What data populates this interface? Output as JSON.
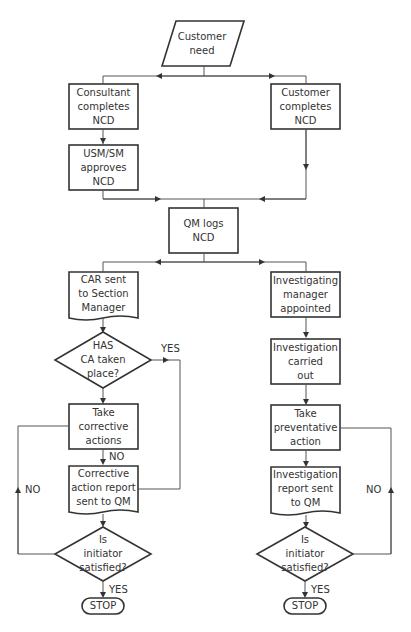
{
  "diagram": {
    "nodes": {
      "customer_need": {
        "lines": [
          "Customer",
          "need"
        ],
        "shape": "parallelogram"
      },
      "consultant_completes": {
        "lines": [
          "Consultant",
          "completes",
          "NCD"
        ],
        "shape": "process"
      },
      "usm_approves": {
        "lines": [
          "USM/SM",
          "approves",
          "NCD"
        ],
        "shape": "process"
      },
      "customer_completes": {
        "lines": [
          "Customer",
          "completes",
          "NCD"
        ],
        "shape": "process"
      },
      "qm_logs": {
        "lines": [
          "QM logs",
          "NCD"
        ],
        "shape": "process"
      },
      "car_sent": {
        "lines": [
          "CAR sent",
          "to Section",
          "Manager"
        ],
        "shape": "document"
      },
      "has_ca": {
        "lines": [
          "HAS",
          "CA taken",
          "place?"
        ],
        "shape": "decision"
      },
      "take_corrective": {
        "lines": [
          "Take",
          "corrective",
          "actions"
        ],
        "shape": "process"
      },
      "corrective_report": {
        "lines": [
          "Corrective",
          "action report",
          "sent to QM"
        ],
        "shape": "document"
      },
      "initiator_left": {
        "lines": [
          "Is",
          "initiator",
          "satisfied?"
        ],
        "shape": "decision"
      },
      "stop_left": {
        "lines": [
          "STOP"
        ],
        "shape": "terminator"
      },
      "investigating_manager": {
        "lines": [
          "Investigating",
          "manager",
          "appointed"
        ],
        "shape": "process"
      },
      "investigation_carried": {
        "lines": [
          "Investigation",
          "carried",
          "out"
        ],
        "shape": "process"
      },
      "take_preventative": {
        "lines": [
          "Take",
          "preventative",
          "action"
        ],
        "shape": "process"
      },
      "investigation_report": {
        "lines": [
          "Investigation",
          "report sent",
          "to QM"
        ],
        "shape": "document"
      },
      "initiator_right": {
        "lines": [
          "Is",
          "initiator",
          "satisfied?"
        ],
        "shape": "decision"
      },
      "stop_right": {
        "lines": [
          "STOP"
        ],
        "shape": "terminator"
      }
    },
    "edge_labels": {
      "has_ca_yes": "YES",
      "take_corrective_no": "NO",
      "left_loop_no": "NO",
      "left_yes": "YES",
      "right_loop_no": "NO",
      "right_yes": "YES"
    },
    "colors": {
      "stroke": "#333333",
      "line": "#555555",
      "text": "#333333",
      "background": "#ffffff"
    }
  }
}
